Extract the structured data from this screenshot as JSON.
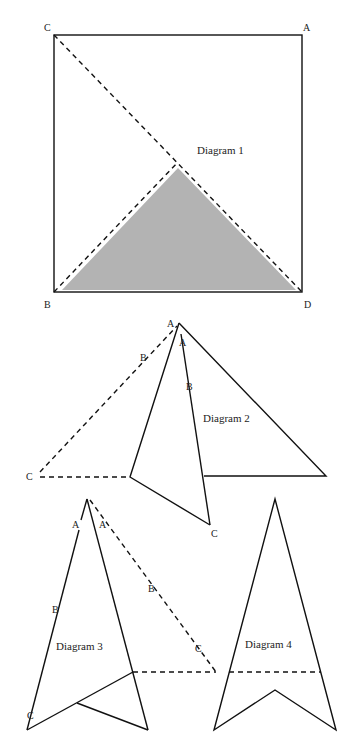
{
  "diagram1": {
    "caption": "Diagram 1",
    "labels": {
      "top_left": "C",
      "top_right": "A",
      "bottom_left": "B",
      "bottom_right": "D"
    },
    "shaded_color": "#b3b3b3"
  },
  "diagram2": {
    "caption": "Diagram 2",
    "labels": {
      "apex_left": "A",
      "apex_inner": "A",
      "inner_mid": "B",
      "inner_end": "C",
      "dashed_mid": "B",
      "dashed_end": "C"
    }
  },
  "diagram3": {
    "caption": "Diagram 3",
    "labels": {
      "left_a": "A",
      "left_b": "B",
      "left_c": "C",
      "dashed_a": "A",
      "dashed_b": "B",
      "dashed_c": "C"
    }
  },
  "diagram4": {
    "caption": "Diagram 4"
  }
}
